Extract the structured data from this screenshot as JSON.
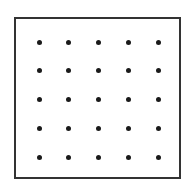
{
  "figure": {
    "type": "dot-grid",
    "rows": 5,
    "cols": 5,
    "border_color": "#333333",
    "dot_color": "#1a1a1a",
    "dot_x": [
      39,
      68,
      98,
      128,
      158
    ],
    "dot_y": [
      42,
      70,
      99,
      128,
      157
    ]
  }
}
